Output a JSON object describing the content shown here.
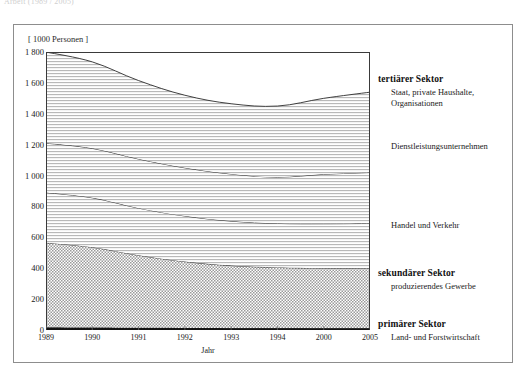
{
  "top_caption": "Arbeit (1989 / 2005)",
  "unit_label": "[ 1000 Personen ]",
  "axis": {
    "x_title": "Jahr",
    "y_ticks": [
      "0",
      "200",
      "400",
      "600",
      "800",
      "1 000",
      "1 200",
      "1 400",
      "1 600",
      "1 800"
    ],
    "x_ticks": [
      "1989",
      "1990",
      "1991",
      "1992",
      "1993",
      "1994",
      "2000",
      "2005"
    ]
  },
  "annotations": [
    {
      "key": "tertiary",
      "title": "tertiärer Sektor",
      "sub_line1": "Staat, private Haushalte,",
      "sub_line2": "Organisationen"
    },
    {
      "key": "services",
      "label": "Dienstleistungsunternehmen"
    },
    {
      "key": "trade-transport",
      "label": "Handel und Verkehr"
    },
    {
      "key": "secondary",
      "title": "sekundärer Sektor",
      "sub_line1": "produzierendes Gewerbe"
    },
    {
      "key": "primary",
      "title": "primärer Sektor",
      "sub_line1": "Land- und Forstwirtschaft"
    }
  ],
  "colors": {
    "frame_border": "#8d8d8d",
    "plot_border": "#3a3a3a",
    "band_primary": "#1a1a1a",
    "band_secondary": "#a8a8a8",
    "band_trade": "#f0f0f0",
    "band_services": "#ededed",
    "band_tertiary": "#e6e6e6",
    "text": "#1a1a1a"
  },
  "chart_data": {
    "type": "area",
    "xlabel": "Jahr",
    "ylabel": "[ 1000 Personen ]",
    "ylim": [
      0,
      1800
    ],
    "xlim": [
      1989,
      2005
    ],
    "grid": false,
    "legend_position": "right",
    "stacked": true,
    "x": [
      1989,
      1990,
      1991,
      1992,
      1993,
      1994,
      2000,
      2005
    ],
    "series": [
      {
        "name": "primärer Sektor",
        "description": "Land- und Forstwirtschaft",
        "values": [
          18,
          16,
          14,
          13,
          12,
          11,
          10,
          10
        ]
      },
      {
        "name": "sekundärer Sektor",
        "description": "produzierendes Gewerbe",
        "values": [
          547,
          520,
          470,
          430,
          405,
          394,
          390,
          390
        ]
      },
      {
        "name": "Handel und Verkehr",
        "description": "Handel und Verkehr",
        "values": [
          325,
          320,
          305,
          295,
          288,
          285,
          288,
          290
        ]
      },
      {
        "name": "Dienstleistungsunternehmen",
        "description": "Dienstleistungsunternehmen",
        "values": [
          320,
          320,
          318,
          312,
          305,
          300,
          320,
          330
        ]
      },
      {
        "name": "tertiärer Sektor",
        "description": "Staat, private Haushalte, Organisationen",
        "values": [
          590,
          560,
          508,
          470,
          455,
          460,
          492,
          520
        ]
      }
    ],
    "totals": [
      1800,
      1736,
      1615,
      1520,
      1465,
      1450,
      1500,
      1540
    ],
    "cumulative_boundaries": {
      "primary_top": [
        18,
        16,
        14,
        13,
        12,
        11,
        10,
        10
      ],
      "secondary_top": [
        565,
        536,
        484,
        443,
        417,
        405,
        400,
        400
      ],
      "trade_top": [
        890,
        856,
        789,
        738,
        705,
        690,
        688,
        690
      ],
      "services_top": [
        1210,
        1176,
        1107,
        1050,
        1010,
        990,
        1008,
        1020
      ],
      "tertiary_top": [
        1800,
        1736,
        1615,
        1520,
        1465,
        1450,
        1500,
        1540
      ]
    }
  }
}
